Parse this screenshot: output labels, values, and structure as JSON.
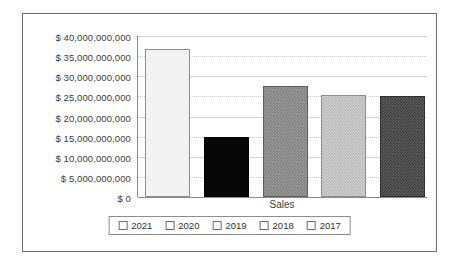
{
  "chart_data": {
    "type": "bar",
    "title": "",
    "xlabel": "Sales",
    "ylabel": "",
    "categories": [
      "2021",
      "2020",
      "2019",
      "2018",
      "2017"
    ],
    "values": [
      36800000000,
      14800000000,
      27700000000,
      25400000000,
      25100000000
    ],
    "series": [
      {
        "name": "Sales",
        "values": [
          36800000000,
          14800000000,
          27700000000,
          25400000000,
          25100000000
        ]
      }
    ],
    "ylim": [
      0,
      40000000000
    ],
    "ytick_values": [
      0,
      5000000000,
      10000000000,
      15000000000,
      20000000000,
      25000000000,
      30000000000,
      35000000000,
      40000000000
    ],
    "ytick_labels": [
      "$ 0",
      "$ 5,000,000,000",
      "$ 10,000,000,000",
      "$ 15,000,000,000",
      "$ 20,000,000,000",
      "$ 25,000,000,000",
      "$ 30,000,000,000",
      "$ 35,000,000,000",
      "$ 40,000,000,000"
    ],
    "grid": true,
    "legend_position": "bottom",
    "legend": [
      {
        "label": "2021",
        "color": "#f2f2f2"
      },
      {
        "label": "2020",
        "color": "#070707"
      },
      {
        "label": "2019",
        "color": "#818181"
      },
      {
        "label": "2018",
        "color": "#bcbcbc"
      },
      {
        "label": "2017",
        "color": "#424242"
      }
    ]
  },
  "axis": {
    "ticks": [
      {
        "label": "$ 40,000,000,000",
        "value": 40000000000
      },
      {
        "label": "$ 35,000,000,000",
        "value": 35000000000
      },
      {
        "label": "$ 30,000,000,000",
        "value": 30000000000
      },
      {
        "label": "$ 25,000,000,000",
        "value": 25000000000
      },
      {
        "label": "$ 20,000,000,000",
        "value": 20000000000
      },
      {
        "label": "$ 15,000,000,000",
        "value": 15000000000
      },
      {
        "label": "$ 10,000,000,000",
        "value": 10000000000
      },
      {
        "label": "$ 5,000,000,000",
        "value": 5000000000
      },
      {
        "label": "$ 0",
        "value": 0
      }
    ]
  }
}
